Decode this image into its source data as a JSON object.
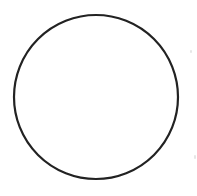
{
  "diagram": {
    "shape": "circle",
    "center": [
      96,
      97
    ],
    "radius": 82,
    "stroke_color": "#222222",
    "stroke_width": 2.2,
    "fill": "#ffffff"
  },
  "background": "#ffffff"
}
